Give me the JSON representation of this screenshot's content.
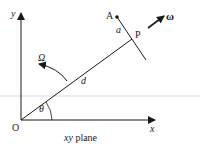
{
  "diagram": {
    "type": "geometry-vector-diagram",
    "caption": "xy plane",
    "labels": {
      "y_axis": "y",
      "x_axis": "x",
      "origin": "O",
      "point_A": "A",
      "point_P": "P",
      "distance_a": "a",
      "distance_d": "d",
      "angle_theta": "θ",
      "angular_velocity_Omega": "Ω",
      "angular_velocity_omega": "ω"
    },
    "colors": {
      "line": "#1a1a1a",
      "faint_rule": "#e6e6e6",
      "background": "#ffffff"
    }
  }
}
